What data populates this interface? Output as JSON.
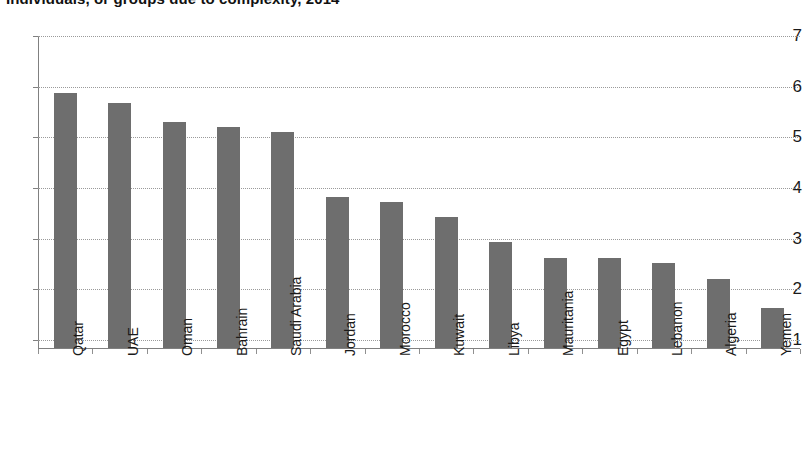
{
  "title": {
    "text": "Individuals, or groups due to complexity, 2014",
    "clipped": true
  },
  "chart_data": {
    "type": "bar",
    "title": "Individuals, or groups due to complexity, 2014",
    "xlabel": "",
    "ylabel": "",
    "ylim": [
      1,
      7
    ],
    "yticks": [
      1,
      2,
      3,
      4,
      5,
      6,
      7
    ],
    "ytick_labels": [
      "1",
      "2",
      "3",
      "4",
      "5",
      "6",
      "7"
    ],
    "grid": true,
    "grid_axis": "y",
    "legend": null,
    "bar_color": "#6e6e6e",
    "categories": [
      "Qatar",
      "UAE",
      "Oman",
      "Bahrain",
      "Saudi Arabia",
      "Jordan",
      "Morocco",
      "Kuwait",
      "Libya",
      "Mauritania",
      "Egypt",
      "Lebanon",
      "Algeria",
      "Yemen"
    ],
    "values": [
      5.88,
      5.68,
      5.3,
      5.2,
      5.1,
      3.83,
      3.72,
      3.43,
      2.93,
      2.61,
      2.61,
      2.52,
      2.21,
      1.63
    ]
  }
}
